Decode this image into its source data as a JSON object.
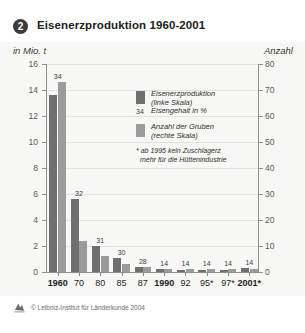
{
  "header": {
    "badge": "2",
    "title": "Eisenerzproduktion 1960-2001"
  },
  "axes": {
    "unit_left": "in Mio. t",
    "unit_right": "Anzahl"
  },
  "legend": {
    "production_label_line1": "Eisenerzproduktion",
    "production_label_line2": "(linke Skala)",
    "iron_content_sample": "34",
    "iron_content_label": "Eisengehalt in %",
    "mines_label_line1": "Anzahl der Gruben",
    "mines_label_line2": "(rechte Skala)",
    "footnote_line1": "* ab 1995 kein Zuschlagerz",
    "footnote_line2": "mehr für die Hüttenindustrie"
  },
  "footer": {
    "copyright": "© Leibniz-Institut für Länderkunde 2004"
  },
  "colors": {
    "production": "#6f6f6f",
    "mines": "#9b9b9b",
    "panel": "#f7f7f5",
    "axis": "#8d8d8d",
    "grid": "#e2e2de"
  },
  "chart_data": {
    "type": "bar",
    "title": "Eisenerzproduktion 1960-2001",
    "xlabel": "",
    "ylabel": "in Mio. t",
    "y2label": "Anzahl",
    "ylim": [
      0,
      16
    ],
    "y2lim": [
      0,
      80
    ],
    "yticks": [
      0,
      2,
      4,
      6,
      8,
      10,
      12,
      14,
      16
    ],
    "y2ticks": [
      0,
      10,
      20,
      30,
      40,
      50,
      60,
      70,
      80
    ],
    "grid": true,
    "legend_position": "inside-upper-right",
    "categories": [
      "1960",
      "70",
      "80",
      "85",
      "87",
      "1990",
      "92",
      "95*",
      "97*",
      "2001*"
    ],
    "series": [
      {
        "name": "Eisenerzproduktion (linke Skala)",
        "axis": "left",
        "unit": "Mio. t",
        "values": [
          13.6,
          5.6,
          2.0,
          1.1,
          0.35,
          0.2,
          0.15,
          0.12,
          0.15,
          0.3
        ]
      },
      {
        "name": "Anzahl der Gruben (rechte Skala)",
        "axis": "right",
        "unit": "Gruben",
        "values": [
          73,
          12,
          6,
          3,
          2,
          1,
          1,
          1,
          1,
          1
        ]
      }
    ],
    "point_labels": {
      "name": "Eisengehalt in %",
      "values": [
        "34",
        "32",
        "31",
        "30",
        "28",
        "14",
        "14",
        "14",
        "14",
        "14"
      ]
    },
    "annotations": [
      "* ab 1995 kein Zuschlagerz mehr für die Hüttenindustrie"
    ]
  }
}
